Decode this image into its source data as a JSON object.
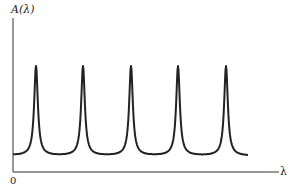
{
  "chart_data": {
    "type": "line",
    "title": "",
    "ylabel": "A(λ)",
    "xlabel": "λ",
    "origin_label": "0",
    "peaks": [
      {
        "x": 36,
        "y_top": 66
      },
      {
        "x": 83,
        "y_top": 66
      },
      {
        "x": 131,
        "y_top": 66
      },
      {
        "x": 178,
        "y_top": 66
      },
      {
        "x": 226,
        "y_top": 66
      }
    ],
    "baseline_min_y": 156,
    "grid": false,
    "legend": null,
    "line_color": "#222222"
  },
  "labels": {
    "y_axis": "A(λ)",
    "x_axis": "λ",
    "origin": "0"
  }
}
